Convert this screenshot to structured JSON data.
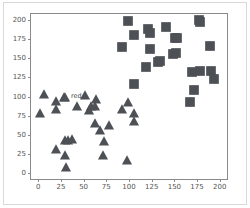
{
  "figure": {
    "background_color": "#ffffff",
    "frame_color": "#d9d9d9",
    "axes_edge_color": "#8a8a8a"
  },
  "chart_data": {
    "type": "scatter",
    "title": "",
    "xlabel": "",
    "ylabel": "",
    "xlim": [
      -8,
      208
    ],
    "ylim": [
      -8,
      208
    ],
    "xticks": [
      0,
      25,
      50,
      75,
      100,
      125,
      150,
      175,
      200
    ],
    "yticks": [
      0,
      25,
      50,
      75,
      100,
      125,
      150,
      175,
      200
    ],
    "xtick_labels": [
      "0",
      "25",
      "50",
      "75",
      "100",
      "125",
      "150",
      "175",
      "200"
    ],
    "ytick_labels": [
      "0",
      "25",
      "50",
      "75",
      "100",
      "125",
      "150",
      "175",
      "200"
    ],
    "grid": false,
    "legend": false,
    "legend_position": "none",
    "annotations": [
      {
        "text": "red",
        "x": 36,
        "y": 101
      }
    ],
    "series": [
      {
        "name": "triangles",
        "marker": "triangle",
        "color": "#4d5055",
        "size": 5.5,
        "points": [
          [
            2,
            78
          ],
          [
            6,
            103
          ],
          [
            19,
            94
          ],
          [
            19,
            31
          ],
          [
            20,
            83
          ],
          [
            28,
            99
          ],
          [
            29,
            100
          ],
          [
            29,
            24
          ],
          [
            30,
            43
          ],
          [
            31,
            8
          ],
          [
            33,
            43
          ],
          [
            37,
            44
          ],
          [
            43,
            88
          ],
          [
            51,
            102
          ],
          [
            56,
            82
          ],
          [
            58,
            88
          ],
          [
            62,
            65
          ],
          [
            63,
            88
          ],
          [
            64,
            97
          ],
          [
            68,
            56
          ],
          [
            71,
            23
          ],
          [
            72,
            42
          ],
          [
            78,
            63
          ],
          [
            92,
            83
          ],
          [
            98,
            17
          ],
          [
            99,
            93
          ],
          [
            105,
            68
          ],
          [
            106,
            79
          ]
        ]
      },
      {
        "name": "squares",
        "marker": "square",
        "color": "#4d5055",
        "size": 5.5,
        "points": [
          [
            92,
            165
          ],
          [
            99,
            199
          ],
          [
            105,
            180
          ],
          [
            106,
            116
          ],
          [
            119,
            139
          ],
          [
            121,
            188
          ],
          [
            123,
            183
          ],
          [
            123,
            162
          ],
          [
            132,
            145
          ],
          [
            134,
            146
          ],
          [
            141,
            191
          ],
          [
            148,
            156
          ],
          [
            151,
            176
          ],
          [
            152,
            157
          ],
          [
            153,
            177
          ],
          [
            167,
            93
          ],
          [
            169,
            132
          ],
          [
            172,
            109
          ],
          [
            177,
            200
          ],
          [
            178,
            197
          ],
          [
            178,
            134
          ],
          [
            189,
            166
          ],
          [
            190,
            133
          ],
          [
            194,
            123
          ]
        ]
      }
    ]
  }
}
